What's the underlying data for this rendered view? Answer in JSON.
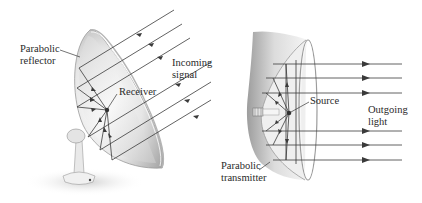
{
  "figure": {
    "left_panel": {
      "title": "Parabolic reflector (receiving antenna)",
      "labels": {
        "reflector_line1": "Parabolic",
        "reflector_line2": "reflector",
        "receiver": "Receiver",
        "signal_line1": "Incoming",
        "signal_line2": "signal"
      },
      "ray_count": 6,
      "ray_direction": "inward"
    },
    "right_panel": {
      "title": "Parabolic transmitter (light source)",
      "labels": {
        "source": "Source",
        "outgoing_line1": "Outgoing",
        "outgoing_line2": "light",
        "transmitter_line1": "Parabolic",
        "transmitter_line2": "transmitter"
      },
      "ray_count": 6,
      "ray_direction": "outward"
    },
    "colors": {
      "ray": "#3a3a3a",
      "dish_light": "#f2f2f2",
      "dish_shadow": "#9a9a9a",
      "text": "#2a2a2a"
    }
  }
}
